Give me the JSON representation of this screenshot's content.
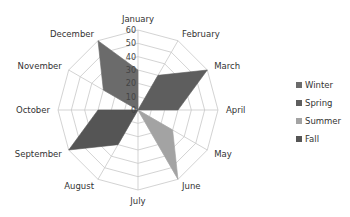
{
  "chart_data": {
    "type": "radar",
    "title": "",
    "categories": [
      "January",
      "February",
      "March",
      "April",
      "May",
      "June",
      "July",
      "August",
      "September",
      "October",
      "November",
      "December"
    ],
    "series": [
      {
        "name": "Winter",
        "color": "#6b6b6b",
        "values": [
          30,
          0,
          0,
          0,
          0,
          0,
          0,
          0,
          0,
          0,
          30,
          60
        ]
      },
      {
        "name": "Spring",
        "color": "#5e5e5e",
        "values": [
          0,
          30,
          60,
          30,
          0,
          0,
          0,
          0,
          0,
          0,
          0,
          0
        ]
      },
      {
        "name": "Summer",
        "color": "#a3a3a3",
        "values": [
          0,
          0,
          0,
          0,
          30,
          60,
          0,
          0,
          0,
          0,
          0,
          0
        ]
      },
      {
        "name": "Fall",
        "color": "#555555",
        "values": [
          0,
          0,
          0,
          0,
          0,
          0,
          0,
          30,
          60,
          30,
          0,
          0
        ]
      }
    ],
    "ticks": [
      0,
      10,
      20,
      30,
      40,
      50,
      60
    ],
    "rlim": [
      0,
      60
    ],
    "grid": true,
    "legend_position": "right"
  },
  "legend": {
    "items": [
      {
        "label": "Winter",
        "color": "#6b6b6b"
      },
      {
        "label": "Spring",
        "color": "#5e5e5e"
      },
      {
        "label": "Summer",
        "color": "#a3a3a3"
      },
      {
        "label": "Fall",
        "color": "#555555"
      }
    ]
  }
}
